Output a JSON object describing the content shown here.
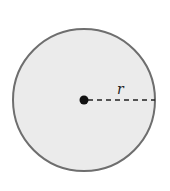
{
  "diagram": {
    "type": "circle-radius",
    "circle": {
      "cx": 84,
      "cy": 100,
      "r": 71,
      "fill": "#ebebeb",
      "stroke": "#6e6e6e"
    },
    "center_point": {
      "cx": 84,
      "cy": 100,
      "r": 4.5,
      "fill": "#111111"
    },
    "radius_line": {
      "x1": 88,
      "y1": 100,
      "x2": 155,
      "y2": 100,
      "style": "dashed",
      "color": "#222222"
    },
    "radius_label": "r"
  }
}
